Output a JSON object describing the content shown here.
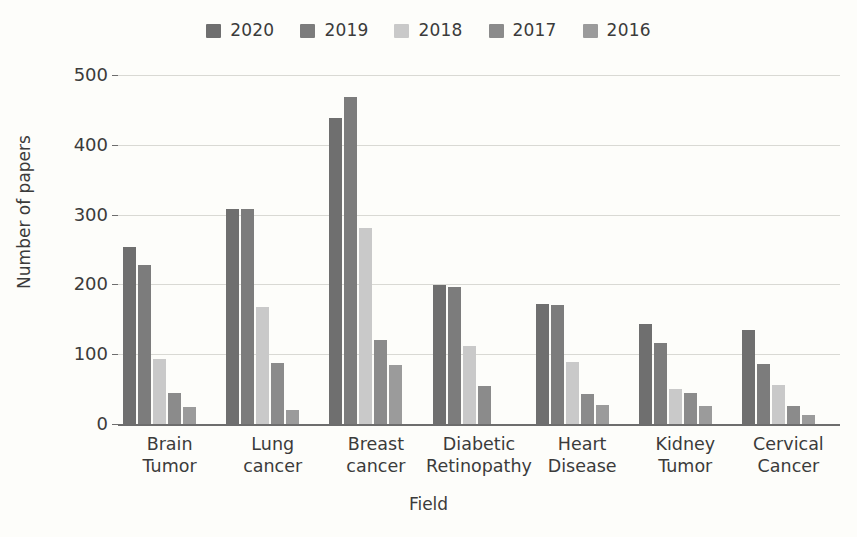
{
  "chart_data": {
    "type": "bar",
    "title": "",
    "subtitle": "",
    "xlabel": "Field",
    "ylabel": "Number of papers",
    "categories": [
      "Brain Tumor",
      "Lung cancer",
      "Breast cancer",
      "Diabetic Retinopathy",
      "Heart Disease",
      "Kidney Tumor",
      "Cervical Cancer"
    ],
    "category_lines": [
      [
        "Brain",
        "Tumor"
      ],
      [
        "Lung",
        "cancer"
      ],
      [
        "Breast",
        "cancer"
      ],
      [
        "Diabetic",
        "Retinopathy"
      ],
      [
        "Heart",
        "Disease"
      ],
      [
        "Kidney",
        "Tumor"
      ],
      [
        "Cervical",
        "Cancer"
      ]
    ],
    "series": [
      {
        "name": "2020",
        "color": "#6f6f6f",
        "values": [
          253,
          308,
          438,
          199,
          172,
          143,
          134
        ]
      },
      {
        "name": "2019",
        "color": "#7c7c7c",
        "values": [
          228,
          308,
          468,
          196,
          171,
          116,
          86
        ]
      },
      {
        "name": "2018",
        "color": "#c9c9c9",
        "values": [
          93,
          167,
          281,
          112,
          89,
          50,
          56
        ]
      },
      {
        "name": "2017",
        "color": "#8b8b8b",
        "values": [
          45,
          88,
          121,
          54,
          43,
          45,
          26
        ]
      },
      {
        "name": "2016",
        "color": "#9b9b9b",
        "values": [
          24,
          20,
          85,
          0,
          27,
          26,
          13
        ]
      }
    ],
    "ylim": [
      0,
      500
    ],
    "yticks": [
      0,
      100,
      200,
      300,
      400,
      500
    ],
    "grid": "horizontal",
    "legend_position": "top-center",
    "background_color": "#fdfdfa",
    "gridline_color": "#d9d9d4",
    "axis_color": "#6d6d6d"
  }
}
